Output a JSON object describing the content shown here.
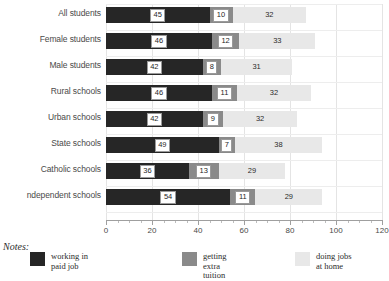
{
  "chart_data": {
    "type": "bar",
    "orientation": "horizontal",
    "stacked": true,
    "title": "",
    "xlabel": "",
    "ylabel": "",
    "xlim": [
      0,
      120
    ],
    "xticks": [
      0,
      20,
      40,
      60,
      80,
      100,
      120
    ],
    "xtick_labels": [
      "0",
      "20",
      "40",
      "60",
      "80",
      "100",
      "120"
    ],
    "minor_tick_step": 5,
    "grid": "vertical-major-and-horizontal-row-separators",
    "legend_position": "bottom",
    "categories": [
      "All students",
      "Female students",
      "Male students",
      "Rural schools",
      "Urban schools",
      "State schools",
      "Catholic schools",
      "ndependent schools"
    ],
    "series": [
      {
        "name": "working in paid job",
        "color": "#262626",
        "values": [
          45,
          46,
          42,
          46,
          42,
          49,
          36,
          54
        ]
      },
      {
        "name": "getting extra tuition",
        "color": "#8a8a8a",
        "values": [
          10,
          12,
          8,
          11,
          9,
          7,
          13,
          11
        ]
      },
      {
        "name": "doing jobs at home",
        "color": "#e8e8e8",
        "values": [
          32,
          33,
          31,
          32,
          32,
          38,
          29,
          29
        ]
      }
    ]
  },
  "notes": {
    "label": "Notes:"
  },
  "legend": {
    "items": [
      {
        "label": "working in\npaid job",
        "color": "#262626"
      },
      {
        "label": "getting\nextra\ntuition",
        "color": "#8a8a8a"
      },
      {
        "label": "doing jobs\nat home",
        "color": "#e8e8e8"
      }
    ]
  },
  "colors": {
    "paid_job": "#262626",
    "extra_tuition": "#8a8a8a",
    "jobs_at_home": "#e8e8e8",
    "gridline": "#e4e4e4",
    "axis": "#9f9f9f",
    "text": "#3a3a3a"
  }
}
